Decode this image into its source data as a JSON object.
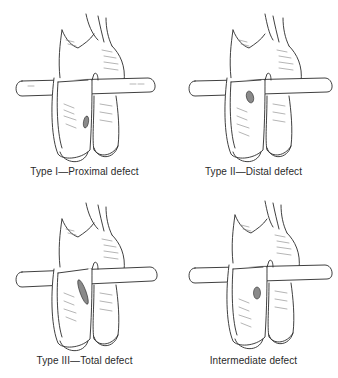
{
  "figure": {
    "panels": [
      {
        "id": "type-1",
        "caption": "Type I—Proximal defect",
        "defect": {
          "cx": 86,
          "cy": 122,
          "rx": 2.5,
          "ry": 6,
          "rot": 10
        }
      },
      {
        "id": "type-2",
        "caption": "Type II—Distal defect",
        "defect": {
          "cx": 81,
          "cy": 97,
          "rx": 3.5,
          "ry": 6,
          "rot": -15
        }
      },
      {
        "id": "type-3",
        "caption": "Type III—Total defect",
        "defect": {
          "cx": 83,
          "cy": 103,
          "rx": 3,
          "ry": 13,
          "rot": -20
        }
      },
      {
        "id": "intermediate",
        "caption": "Intermediate defect",
        "defect": {
          "cx": 88,
          "cy": 104,
          "rx": 3.5,
          "ry": 6,
          "rot": 0
        }
      }
    ],
    "colors": {
      "line": "#2a2a2a",
      "shade": "#6a6a6a",
      "defect_fill": "#8a8a8a",
      "background": "#ffffff"
    }
  }
}
